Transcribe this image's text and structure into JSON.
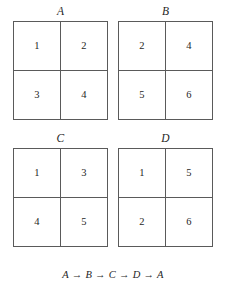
{
  "figure": {
    "caption": "A → B → C → D → A",
    "colors": {
      "background": "#ffffff",
      "border": "#5a5a5a",
      "text": "#1f1f1f"
    },
    "grids": [
      {
        "label": "A",
        "cells": [
          "1",
          "2",
          "3",
          "4"
        ],
        "top_left": "1",
        "top_right": "2",
        "bottom_left": "3",
        "bottom_right": "4"
      },
      {
        "label": "B",
        "cells": [
          "2",
          "4",
          "5",
          "6"
        ],
        "top_left": "2",
        "top_right": "4",
        "bottom_left": "5",
        "bottom_right": "6"
      },
      {
        "label": "C",
        "cells": [
          "1",
          "3",
          "4",
          "5"
        ],
        "top_left": "1",
        "top_right": "3",
        "bottom_left": "4",
        "bottom_right": "5"
      },
      {
        "label": "D",
        "cells": [
          "1",
          "5",
          "2",
          "6"
        ],
        "top_left": "1",
        "top_right": "5",
        "bottom_left": "2",
        "bottom_right": "6"
      }
    ]
  }
}
